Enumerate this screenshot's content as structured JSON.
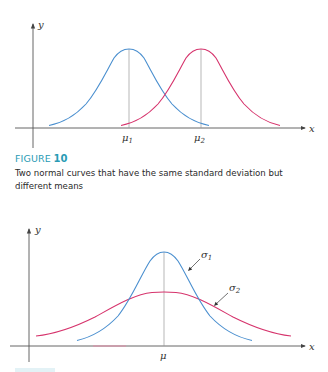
{
  "figure_top": {
    "axis_labels": {
      "x": "x",
      "y": "y"
    },
    "curves": [
      {
        "name": "normal curve 1",
        "color": "#4a8fcf",
        "mean_label": "μ₁",
        "mean_sub": "1",
        "peak": "same height",
        "std_dev": "same"
      },
      {
        "name": "normal curve 2",
        "color": "#d6336c",
        "mean_label": "μ₂",
        "mean_sub": "2",
        "peak": "same height",
        "std_dev": "same"
      }
    ],
    "mean_labels": {
      "mu1_base": "μ",
      "mu1_sub": "1",
      "mu2_base": "μ",
      "mu2_sub": "2"
    }
  },
  "caption": {
    "figure_word": "FIGURE",
    "figure_number": "10",
    "text": "Two normal curves that have the same standard deviation but different means"
  },
  "figure_bottom": {
    "axis_labels": {
      "x": "x",
      "y": "y"
    },
    "mean_label": "μ",
    "curves": [
      {
        "name": "narrow normal curve",
        "color": "#4a8fcf",
        "label_base": "σ",
        "label_sub": "1"
      },
      {
        "name": "wide normal curve",
        "color": "#d6336c",
        "label_base": "σ",
        "label_sub": "2"
      }
    ],
    "sigma_labels": {
      "s1_base": "σ",
      "s1_sub": "1",
      "s2_base": "σ",
      "s2_sub": "2"
    }
  },
  "colors": {
    "blue_curve": "#4a8fcf",
    "pink_curve": "#d6336c",
    "axis": "#555555",
    "caption_accent": "#2a9bb5"
  }
}
